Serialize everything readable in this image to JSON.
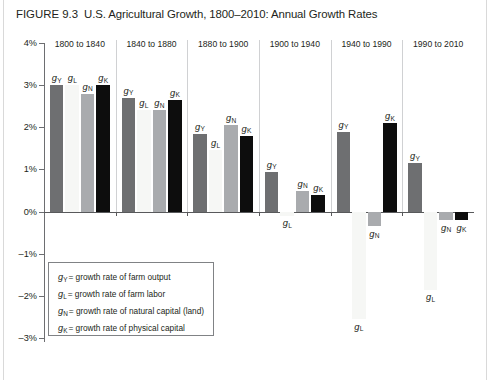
{
  "figure": {
    "number": "FIGURE 9.3",
    "title": "U.S. Agricultural Growth, 1800–2010: Annual Growth Rates"
  },
  "axis": {
    "ticks": [
      "4%",
      "3%",
      "2%",
      "1%",
      "0%",
      "–1%",
      "–2%",
      "–3%"
    ],
    "tick_values": [
      4,
      3,
      2,
      1,
      0,
      -1,
      -2,
      -3
    ],
    "ymin": -3,
    "ymax": 4
  },
  "legend": {
    "items": [
      {
        "symbol": "g",
        "sub": "Y",
        "text": "= growth rate of farm output"
      },
      {
        "symbol": "g",
        "sub": "L",
        "text": "= growth rate of farm labor"
      },
      {
        "symbol": "g",
        "sub": "N",
        "text": "= growth rate of natural capital (land)"
      },
      {
        "symbol": "g",
        "sub": "K",
        "text": "= growth rate of physical capital"
      }
    ]
  },
  "chart_data": {
    "type": "bar",
    "title": "U.S. Agricultural Growth, 1800–2010: Annual Growth Rates",
    "xlabel": "",
    "ylabel": "",
    "ylim": [
      -3,
      4
    ],
    "yticks": [
      -3,
      -2,
      -1,
      0,
      1,
      2,
      3,
      4
    ],
    "ytick_labels": [
      "–3%",
      "–2%",
      "–1%",
      "0%",
      "1%",
      "2%",
      "3%",
      "4%"
    ],
    "grid": false,
    "legend_position": "inside-bottom-left",
    "categories": [
      "1800 to 1840",
      "1840 to 1880",
      "1880 to 1900",
      "1900 to 1940",
      "1940 to 1990",
      "1990 to 2010"
    ],
    "series": [
      {
        "name": "gY",
        "label": "g",
        "sub": "Y",
        "color": "#6e6f71",
        "values": [
          3.0,
          2.7,
          1.85,
          0.95,
          1.9,
          1.15
        ]
      },
      {
        "name": "gL",
        "label": "g",
        "sub": "L",
        "color": "#f6f7f5",
        "values": [
          3.0,
          2.4,
          1.45,
          -0.1,
          -2.55,
          -1.85
        ]
      },
      {
        "name": "gN",
        "label": "g",
        "sub": "N",
        "color": "#a9abae",
        "values": [
          2.8,
          2.4,
          2.05,
          0.5,
          -0.35,
          -0.2
        ]
      },
      {
        "name": "gK",
        "label": "g",
        "sub": "K",
        "color": "#0d0d0d",
        "values": [
          3.0,
          2.65,
          1.8,
          0.4,
          2.1,
          -0.2
        ]
      }
    ]
  }
}
